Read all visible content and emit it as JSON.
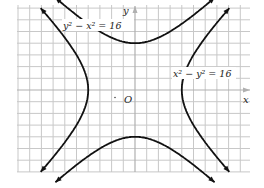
{
  "diagram": {
    "title": "",
    "axes": {
      "x_label": "x",
      "y_label": "y",
      "origin_label": "O"
    },
    "grid": {
      "unit_px": 11.7,
      "origin_px": [
        135,
        90
      ],
      "x_range": [
        -10,
        10
      ],
      "y_range": [
        -7,
        7
      ]
    },
    "curves": [
      {
        "name": "vertical-hyperbola",
        "equation": "y² − x² = 16",
        "label": "y² − x² = 16",
        "vertices": [
          [
            0,
            4
          ],
          [
            0,
            -4
          ]
        ]
      },
      {
        "name": "horizontal-hyperbola",
        "equation": "x² − y² = 16",
        "label": "x² − y² = 16",
        "vertices": [
          [
            4,
            0
          ],
          [
            -4,
            0
          ]
        ]
      }
    ],
    "colors": {
      "grid": "#c8c8c8",
      "axis": "#b0b0b0",
      "curve": "#111111",
      "text": "#222222"
    }
  }
}
